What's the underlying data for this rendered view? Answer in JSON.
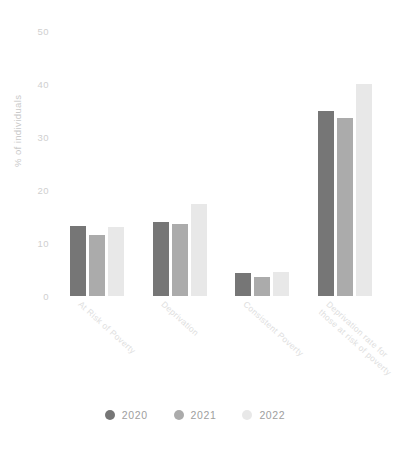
{
  "chart_data": {
    "type": "bar",
    "title": "",
    "subtitle": "",
    "xlabel": "",
    "ylabel": "% of individuals",
    "ylim": [
      0,
      50
    ],
    "yticks": [
      "0",
      "10",
      "20",
      "30",
      "40",
      "50"
    ],
    "ytick_values": [
      0,
      10,
      20,
      30,
      40,
      50
    ],
    "grid": false,
    "legend_position": "bottom",
    "orientation": "vertical",
    "categories": [
      "At Risk of Poverty",
      "Deprivation",
      "Consistent Poverty",
      "Deprivation rate for those at risk of poverty"
    ],
    "category_lines": [
      [
        "At Risk of Poverty"
      ],
      [
        "Deprivation"
      ],
      [
        "Consistent Poverty"
      ],
      [
        "Deprivation rate for",
        "those at risk of poverty"
      ]
    ],
    "series": [
      {
        "name": "2020",
        "color": "#767676",
        "values": [
          13.2,
          14.0,
          4.3,
          34.9
        ]
      },
      {
        "name": "2021",
        "color": "#ababab",
        "values": [
          11.6,
          13.6,
          3.5,
          33.5
        ]
      },
      {
        "name": "2022",
        "color": "#e8e8e8",
        "values": [
          13.1,
          17.3,
          4.5,
          40.0
        ]
      }
    ]
  },
  "axis": {
    "y_title": "% of individuals",
    "tick_0": "0",
    "tick_10": "10",
    "tick_20": "20",
    "tick_30": "30",
    "tick_40": "40",
    "tick_50": "50"
  },
  "categories": {
    "c0_l1": "At Risk of Poverty",
    "c1_l1": "Deprivation",
    "c2_l1": "Consistent Poverty",
    "c3_l1": "Deprivation rate for",
    "c3_l2": "those at risk of poverty"
  },
  "legend": {
    "items": [
      {
        "label": "2020",
        "color": "#767676"
      },
      {
        "label": "2021",
        "color": "#ababab"
      },
      {
        "label": "2022",
        "color": "#e8e8e8"
      }
    ]
  },
  "colors": {
    "series_2020": "#767676",
    "series_2021": "#ababab",
    "series_2022": "#e8e8e8",
    "tick_text": "#cfcfcf",
    "category_text": "#dedede",
    "legend_text": "#9e9e9e",
    "background": "#ffffff"
  }
}
